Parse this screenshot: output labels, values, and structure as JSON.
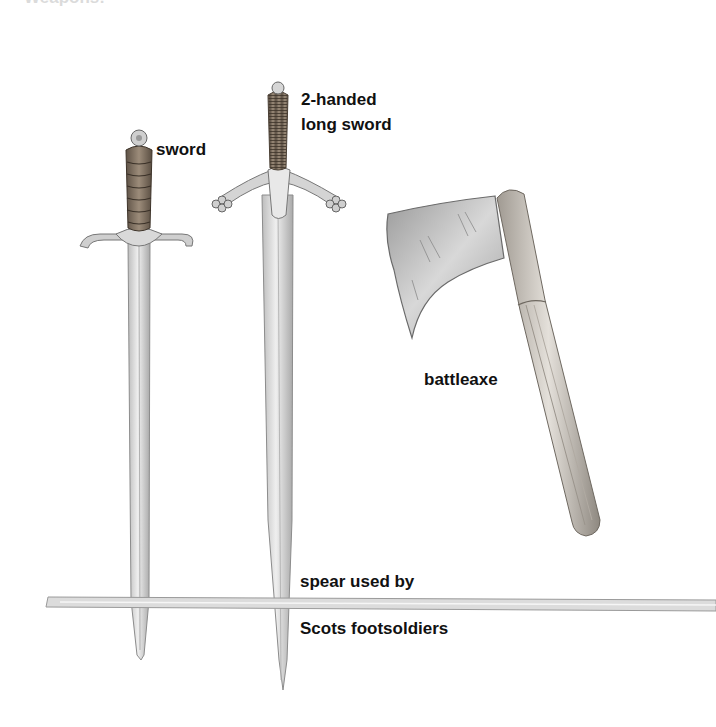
{
  "illustration": {
    "subject": "Medieval Scottish weapons",
    "top_cut_text": "Weapons:",
    "labels": {
      "sword": "sword",
      "longsword_line1": "2-handed",
      "longsword_line2": "long sword",
      "battleaxe": "battleaxe",
      "spear_line1": "spear used by",
      "spear_line2": "Scots footsoldiers"
    },
    "colors": {
      "blade": "#d9d9d9",
      "blade_shade": "#a8a8a8",
      "grip": "#7a6a5a",
      "handle": "#c8c4be",
      "axe_head": "#b5b5b5",
      "text": "#111111"
    }
  }
}
